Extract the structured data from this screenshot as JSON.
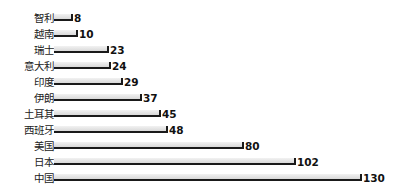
{
  "chart_data": {
    "type": "bar",
    "orientation": "horizontal",
    "title": "",
    "xlabel": "",
    "ylabel": "",
    "grid": false,
    "legend": null,
    "categories": [
      "智利",
      "越南",
      "瑞士",
      "意大利",
      "印度",
      "伊朗",
      "土耳其",
      "西班牙",
      "美国",
      "日本",
      "中国"
    ],
    "values": [
      8,
      10,
      23,
      24,
      29,
      37,
      45,
      48,
      80,
      102,
      130
    ],
    "data_labels": [
      "8",
      "10",
      "23",
      "24",
      "29",
      "37",
      "45",
      "48",
      "80",
      "102",
      "130"
    ],
    "xlim": [
      0,
      130
    ]
  },
  "style": {
    "bar_fill": "#e3e3e3",
    "bar_edge": "#1a1a1a",
    "text_color": "#222222"
  }
}
